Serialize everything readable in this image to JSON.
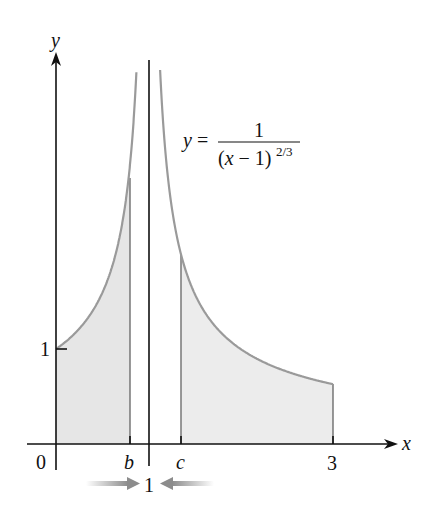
{
  "figure": {
    "equation": {
      "lhs": "y =",
      "numerator": "1",
      "denominator_base": "(x − 1)",
      "denominator_exponent": "2/3"
    },
    "axes": {
      "x_label": "x",
      "y_label": "y"
    },
    "tick_labels": {
      "origin": "0",
      "b": "b",
      "c": "c",
      "three": "3",
      "y_one": "1",
      "asymptote_one": "1"
    },
    "colors": {
      "curve": "#9a9a9a",
      "fill": "#e6e6e6",
      "axis": "#111111",
      "arrow": "#8c8c8c"
    }
  },
  "chart_data": {
    "type": "area",
    "xlabel": "x",
    "ylabel": "y",
    "function": "1/(x-1)^(2/3)",
    "vertical_asymptote": 1,
    "xlim": [
      0,
      3
    ],
    "x_ticks": [
      "0",
      "b",
      "c",
      "3"
    ],
    "y_ticks": [
      "1"
    ],
    "shaded_regions": [
      {
        "from": 0,
        "to": "b",
        "approx_to": 0.8
      },
      {
        "from": "c",
        "to": 3,
        "approx_from": 1.35
      }
    ],
    "annotations": [
      "b → 1 ← c (limits approaching 1)"
    ],
    "points": [
      {
        "x": 0,
        "y": 1
      },
      {
        "x": 3,
        "y": 0.63
      }
    ],
    "grid": false
  }
}
